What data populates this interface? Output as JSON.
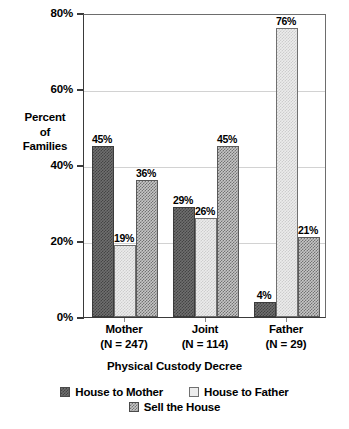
{
  "chart_data": {
    "type": "bar",
    "title": "",
    "xlabel": "Physical Custody Decree",
    "ylabel": "Percent of Families",
    "ylabel_lines": [
      "Percent",
      "of",
      "Families"
    ],
    "categories": [
      "Mother",
      "Joint",
      "Father"
    ],
    "category_sublabels": [
      "(N = 247)",
      "(N = 114)",
      "(N = 29)"
    ],
    "series": [
      {
        "name": "House to Mother",
        "values": [
          45,
          29,
          4
        ],
        "color": "#6f6f6f",
        "pattern": "dark-checker"
      },
      {
        "name": "House to Father",
        "values": [
          19,
          26,
          76
        ],
        "color": "#ececec",
        "pattern": "light-solid"
      },
      {
        "name": "Sell the House",
        "values": [
          36,
          45,
          21
        ],
        "color": "#c6c6c6",
        "pattern": "mid-checker"
      }
    ],
    "data_labels": [
      [
        "45%",
        "29%",
        "4%"
      ],
      [
        "19%",
        "26%",
        "76%"
      ],
      [
        "36%",
        "45%",
        "21%"
      ]
    ],
    "ylim": [
      0,
      80
    ],
    "yticks": [
      0,
      20,
      40,
      60,
      80
    ],
    "ytick_labels": [
      "0%",
      "20%",
      "40%",
      "60%",
      "80%"
    ],
    "grid": true,
    "grid_axis": "y",
    "legend_position": "bottom"
  },
  "axis": {
    "y_title_line1": "Percent",
    "y_title_line2": "of",
    "y_title_line3": "Families",
    "x_title": "Physical Custody Decree"
  },
  "ticks": {
    "y": [
      {
        "label": "80%",
        "value": 80
      },
      {
        "label": "60%",
        "value": 60
      },
      {
        "label": "40%",
        "value": 40
      },
      {
        "label": "20%",
        "value": 20
      },
      {
        "label": "0%",
        "value": 0
      }
    ]
  },
  "groups": [
    {
      "name": "Mother",
      "sublabel": "(N = 247)",
      "bars": [
        {
          "series": "House to Mother",
          "value": 45,
          "label": "45%"
        },
        {
          "series": "House to Father",
          "value": 19,
          "label": "19%"
        },
        {
          "series": "Sell the House",
          "value": 36,
          "label": "36%"
        }
      ]
    },
    {
      "name": "Joint",
      "sublabel": "(N = 114)",
      "bars": [
        {
          "series": "House to Mother",
          "value": 29,
          "label": "29%"
        },
        {
          "series": "House to Father",
          "value": 26,
          "label": "26%"
        },
        {
          "series": "Sell the House",
          "value": 45,
          "label": "45%"
        }
      ]
    },
    {
      "name": "Father",
      "sublabel": "(N = 29)",
      "bars": [
        {
          "series": "House to Mother",
          "value": 4,
          "label": "4%"
        },
        {
          "series": "House to Father",
          "value": 76,
          "label": "76%"
        },
        {
          "series": "Sell the House",
          "value": 21,
          "label": "21%"
        }
      ]
    }
  ],
  "legend": {
    "row1": [
      {
        "label": "House to Mother",
        "swatch": "dark-checker-swatch"
      },
      {
        "label": "House to Father",
        "swatch": "light-swatch"
      }
    ],
    "row2": [
      {
        "label": "Sell the House",
        "swatch": "mid-checker-swatch"
      }
    ]
  }
}
